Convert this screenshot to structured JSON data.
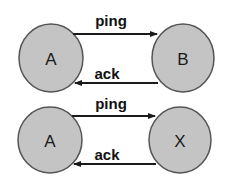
{
  "diagram": {
    "colors": {
      "node_fill": "#c4c4c4",
      "node_stroke": "#555555",
      "edge": "#1a1a1a",
      "text": "#111111"
    },
    "scenarios": [
      {
        "left_node": {
          "label": "A"
        },
        "right_node": {
          "label": "B"
        },
        "edges": [
          {
            "label": "ping",
            "direction": "left-to-right"
          },
          {
            "label": "ack",
            "direction": "right-to-left"
          }
        ]
      },
      {
        "left_node": {
          "label": "A"
        },
        "right_node": {
          "label": "X"
        },
        "edges": [
          {
            "label": "ping",
            "direction": "left-to-right"
          },
          {
            "label": "ack",
            "direction": "right-to-left"
          }
        ]
      }
    ]
  }
}
